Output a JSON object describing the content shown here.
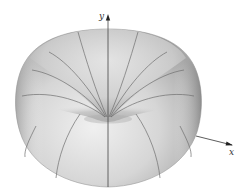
{
  "figure": {
    "axes": {
      "y_label": "y",
      "x_label": "x"
    },
    "colors": {
      "surface_light": "#e9e9e9",
      "surface_mid": "#c4c4c4",
      "surface_dark": "#8f8f8f",
      "mesh_line": "#6f6f6f",
      "axis": "#333333",
      "background": "#ffffff"
    }
  }
}
